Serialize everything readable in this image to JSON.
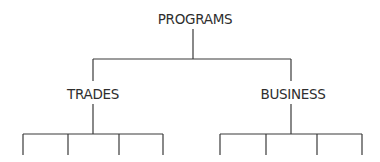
{
  "diagram": {
    "type": "org-chart / tree",
    "root": {
      "label": "PROGRAMS",
      "children": [
        {
          "label": "TRADES",
          "children_count": 4
        },
        {
          "label": "BUSINESS",
          "children_count": 4
        }
      ]
    },
    "colors": {
      "line": "#3a3a3a",
      "text": "#2e2e2e",
      "background": "#ffffff"
    }
  }
}
